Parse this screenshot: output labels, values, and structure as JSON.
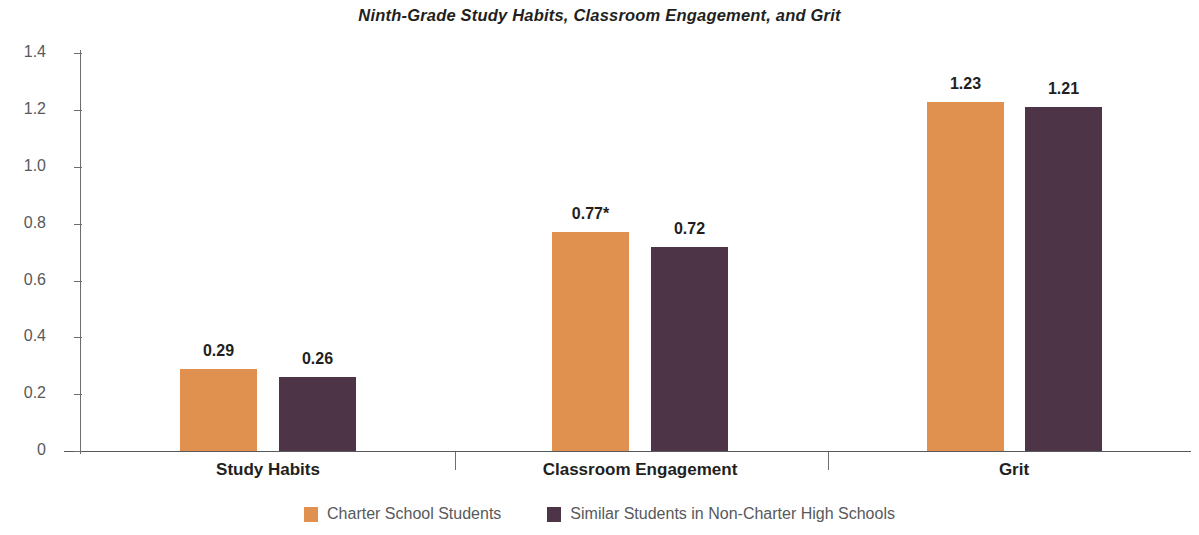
{
  "chart_data": {
    "type": "bar",
    "title": "Ninth-Grade Study Habits, Classroom Engagement, and Grit",
    "xlabel": "",
    "ylabel": "Standard Deviations",
    "categories": [
      "Study Habits",
      "Classroom Engagement",
      "Grit"
    ],
    "series": [
      {
        "name": "Charter School Students",
        "color": "#e0904f",
        "values": [
          0.29,
          0.77,
          1.23
        ],
        "value_labels": [
          "0.29",
          "0.77*",
          "1.21-placeholder"
        ]
      },
      {
        "name": "Similar Students in Non-Charter High Schools",
        "color": "#4d3446",
        "values": [
          0.26,
          0.72,
          1.21
        ],
        "value_labels": [
          "0.26",
          "0.72",
          "1.21"
        ]
      }
    ],
    "ylim": [
      0,
      1.4
    ],
    "yticks": [
      0,
      0.2,
      0.4,
      0.6,
      0.8,
      1.0,
      1.2,
      1.4
    ],
    "ytick_labels": [
      "0",
      "0.2",
      "0.4",
      "0.6",
      "0.8",
      "1.0",
      "1.2",
      "1.4"
    ],
    "grid": false,
    "legend_position": "bottom",
    "annotations": [
      "* denotes statistical significance marker on Charter School Students Classroom Engagement value"
    ]
  },
  "title": "Ninth-Grade Study Habits, Classroom Engagement, and Grit",
  "y_axis": {
    "title": "Standard Deviations",
    "ticks": [
      {
        "value": 1.4,
        "label": "1.4"
      },
      {
        "value": 1.2,
        "label": "1.2"
      },
      {
        "value": 1.0,
        "label": "1.0"
      },
      {
        "value": 0.8,
        "label": "0.8"
      },
      {
        "value": 0.6,
        "label": "0.6"
      },
      {
        "value": 0.4,
        "label": "0.4"
      },
      {
        "value": 0.2,
        "label": "0.2"
      },
      {
        "value": 0.0,
        "label": "0"
      }
    ]
  },
  "groups": [
    {
      "label": "Study Habits",
      "bars": [
        {
          "series": "Charter School Students",
          "value": 0.29,
          "label": "0.29",
          "color": "#e0904f"
        },
        {
          "series": "Similar Students in Non-Charter High Schools",
          "value": 0.26,
          "label": "0.26",
          "color": "#4d3446"
        }
      ]
    },
    {
      "label": "Classroom Engagement",
      "bars": [
        {
          "series": "Charter School Students",
          "value": 0.77,
          "label": "0.77*",
          "color": "#e0904f"
        },
        {
          "series": "Similar Students in Non-Charter High Schools",
          "value": 0.72,
          "label": "0.72",
          "color": "#4d3446"
        }
      ]
    },
    {
      "label": "Grit",
      "bars": [
        {
          "series": "Charter School Students",
          "value": 1.23,
          "label": "1.23",
          "color": "#e0904f"
        },
        {
          "series": "Similar Students in Non-Charter High Schools",
          "value": 1.21,
          "label": "1.21",
          "color": "#4d3446"
        }
      ]
    }
  ],
  "legend": [
    {
      "label": "Charter School Students",
      "color": "#e0904f"
    },
    {
      "label": "Similar Students in Non-Charter High Schools",
      "color": "#4d3446"
    }
  ]
}
